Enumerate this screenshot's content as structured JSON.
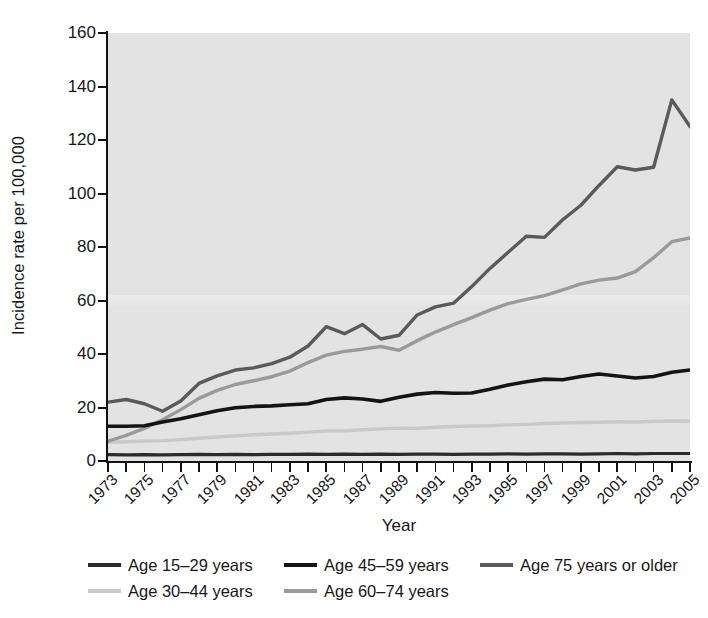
{
  "figure": {
    "background": "#ffffff",
    "plot_background": "#e3e3e3"
  },
  "axes": {
    "ylabel": "Incidence rate per 100,000",
    "xlabel": "Year",
    "yticks": [
      "0",
      "20",
      "40",
      "60",
      "80",
      "100",
      "120",
      "140",
      "160"
    ],
    "xticks": [
      "1973",
      "1975",
      "1977",
      "1979",
      "1981",
      "1983",
      "1985",
      "1987",
      "1989",
      "1991",
      "1993",
      "1995",
      "1997",
      "1999",
      "2001",
      "2003",
      "2005"
    ]
  },
  "legend": {
    "items": [
      {
        "label": "Age 15–29 years",
        "color": "#2b2b2b"
      },
      {
        "label": "Age 45–59 years",
        "color": "#141414"
      },
      {
        "label": "Age 75 years or older",
        "color": "#5a5a5a"
      },
      {
        "label": "Age 30–44 years",
        "color": "#c9c9c9"
      },
      {
        "label": "Age 60–74 years",
        "color": "#9a9a9a"
      }
    ]
  },
  "chart_data": {
    "type": "line",
    "title": "",
    "xlabel": "Year",
    "ylabel": "Incidence rate per 100,000",
    "xlim": [
      1973,
      2005
    ],
    "ylim": [
      0,
      160
    ],
    "ytick_step": 20,
    "grid": false,
    "legend_position": "below-axis",
    "x": [
      1973,
      1974,
      1975,
      1976,
      1977,
      1978,
      1979,
      1980,
      1981,
      1982,
      1983,
      1984,
      1985,
      1986,
      1987,
      1988,
      1989,
      1990,
      1991,
      1992,
      1993,
      1994,
      1995,
      1996,
      1997,
      1998,
      1999,
      2000,
      2001,
      2002,
      2003,
      2004,
      2005
    ],
    "series": [
      {
        "name": "Age 15–29 years",
        "color": "#2b2b2b",
        "values": [
          2.4,
          2.3,
          2.4,
          2.3,
          2.4,
          2.5,
          2.4,
          2.5,
          2.4,
          2.5,
          2.5,
          2.6,
          2.5,
          2.6,
          2.5,
          2.6,
          2.5,
          2.6,
          2.6,
          2.5,
          2.6,
          2.6,
          2.7,
          2.6,
          2.7,
          2.7,
          2.6,
          2.7,
          2.8,
          2.7,
          2.8,
          2.8,
          2.8
        ]
      },
      {
        "name": "Age 30–44 years",
        "color": "#c9c9c9",
        "values": [
          7.0,
          7.2,
          7.5,
          7.6,
          8.0,
          8.5,
          9.0,
          9.4,
          9.8,
          10.1,
          10.4,
          10.8,
          11.2,
          11.3,
          11.7,
          12.0,
          12.3,
          12.2,
          12.6,
          12.9,
          13.1,
          13.2,
          13.5,
          13.7,
          14.0,
          14.2,
          14.4,
          14.5,
          14.7,
          14.6,
          14.8,
          15.0,
          14.9
        ]
      },
      {
        "name": "Age 45–59 years",
        "color": "#141414",
        "values": [
          13.0,
          13.0,
          13.2,
          14.6,
          15.8,
          17.3,
          18.8,
          19.9,
          20.4,
          20.6,
          21.0,
          21.4,
          23.0,
          23.6,
          23.2,
          22.3,
          23.8,
          25.0,
          25.6,
          25.3,
          25.4,
          26.8,
          28.4,
          29.6,
          30.6,
          30.4,
          31.6,
          32.5,
          31.8,
          31.0,
          31.6,
          33.2,
          34.0
        ]
      },
      {
        "name": "Age 60–74 years",
        "color": "#9a9a9a",
        "values": [
          7.4,
          9.6,
          12.2,
          15.4,
          19.2,
          23.4,
          26.4,
          28.6,
          30.0,
          31.5,
          33.6,
          36.8,
          39.6,
          41.0,
          41.8,
          42.8,
          41.4,
          45.0,
          48.2,
          51.0,
          53.6,
          56.4,
          58.8,
          60.4,
          61.8,
          64.0,
          66.2,
          67.6,
          68.4,
          70.8,
          76.0,
          82.0,
          83.4
        ]
      },
      {
        "name": "Age 75 years or older",
        "color": "#5a5a5a",
        "values": [
          22.0,
          23.0,
          21.4,
          18.6,
          22.4,
          29.0,
          31.8,
          34.0,
          34.8,
          36.4,
          38.8,
          43.0,
          50.2,
          47.6,
          51.0,
          45.6,
          47.0,
          54.6,
          57.6,
          59.0,
          65.2,
          72.0,
          78.0,
          84.0,
          83.6,
          90.2,
          95.6,
          103.0,
          110.0,
          108.8,
          109.8,
          135.0,
          125.0
        ]
      }
    ]
  }
}
